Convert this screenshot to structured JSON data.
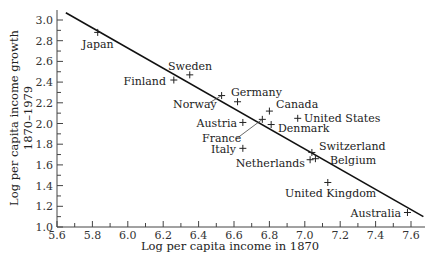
{
  "chart_data": {
    "type": "scatter",
    "title": "",
    "xlabel": "Log per capita income in 1870",
    "ylabel": [
      "Log per capita income growth",
      "1870–1979"
    ],
    "xlim": [
      5.6,
      7.7
    ],
    "ylim": [
      1.0,
      3.05
    ],
    "x_ticks": [
      "5.6",
      "5.8",
      "6.0",
      "6.2",
      "6.4",
      "6.6",
      "6.8",
      "7.0",
      "7.2",
      "7.4",
      "7.6"
    ],
    "y_ticks": [
      "1.0",
      "1.2",
      "1.4",
      "1.6",
      "1.8",
      "2.0",
      "2.2",
      "2.4",
      "2.6",
      "2.8",
      "3.0"
    ],
    "grid": false,
    "marker": "+",
    "points": [
      {
        "label": "Japan",
        "x": 5.83,
        "y": 2.88
      },
      {
        "label": "Finland",
        "x": 6.26,
        "y": 2.42
      },
      {
        "label": "Sweden",
        "x": 6.35,
        "y": 2.47
      },
      {
        "label": "Norway",
        "x": 6.53,
        "y": 2.27
      },
      {
        "label": "Germany",
        "x": 6.62,
        "y": 2.21
      },
      {
        "label": "Canada",
        "x": 6.8,
        "y": 2.12
      },
      {
        "label": "France",
        "x": 6.76,
        "y": 2.04
      },
      {
        "label": "Austria",
        "x": 6.65,
        "y": 2.01
      },
      {
        "label": "Denmark",
        "x": 6.81,
        "y": 1.99
      },
      {
        "label": "United States",
        "x": 6.96,
        "y": 2.05
      },
      {
        "label": "Italy",
        "x": 6.65,
        "y": 1.76
      },
      {
        "label": "Switzerland",
        "x": 7.04,
        "y": 1.72
      },
      {
        "label": "Netherlands",
        "x": 7.03,
        "y": 1.65
      },
      {
        "label": "Belgium",
        "x": 7.06,
        "y": 1.66
      },
      {
        "label": "United Kingdom",
        "x": 7.13,
        "y": 1.43
      },
      {
        "label": "Australia",
        "x": 7.58,
        "y": 1.14
      }
    ],
    "trend_line": {
      "x1": 5.65,
      "y1": 3.07,
      "x2": 7.67,
      "y2": 1.1
    }
  }
}
